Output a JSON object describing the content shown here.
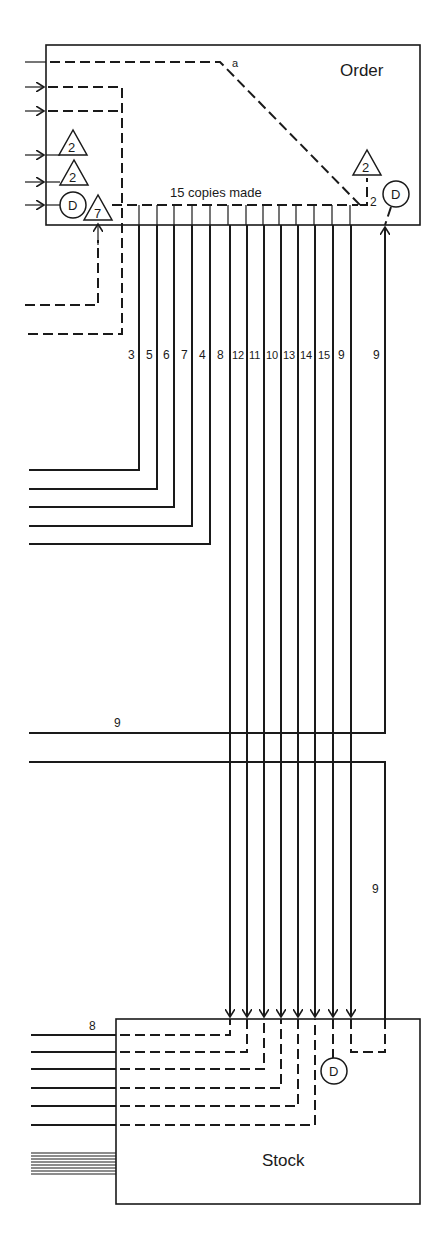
{
  "diagram": {
    "type": "flow-diagram",
    "boxes": {
      "order": {
        "label": "Order"
      },
      "stock": {
        "label": "Stock"
      }
    },
    "annotations": {
      "copies_label": "15 copies made",
      "point_a": "a",
      "branch_2": "2"
    },
    "symbols": {
      "triangle_left_1": "2",
      "triangle_left_2": "2",
      "triangle_left_7": "7",
      "triangle_right_2": "2",
      "circle_left_d": "D",
      "circle_right_d": "D",
      "circle_stock_d": "D"
    },
    "copy_line_labels": [
      "3",
      "5",
      "6",
      "7",
      "4",
      "8",
      "12",
      "11",
      "10",
      "13",
      "14",
      "15",
      "9"
    ],
    "return_line_label": "9",
    "horizontal_9_label": "9",
    "vertical_9_label": "9",
    "stock_input_label": "8"
  }
}
